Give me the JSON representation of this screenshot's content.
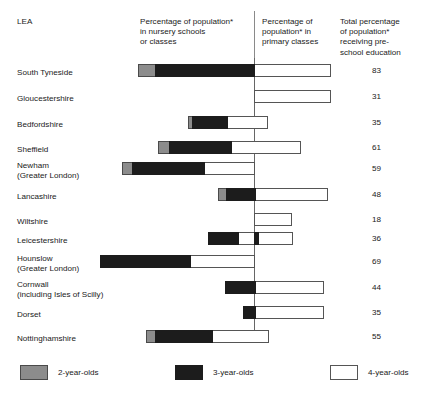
{
  "header": {
    "lea_label": "LEA",
    "col_nursery": "Percentage of population*\nin nursery schools\nor classes",
    "col_primary": "Percentage of\npopulation* in\nprimary classes",
    "col_total": "Total percentage\nof population*\nreceiving pre-\nschool education"
  },
  "legend": {
    "items": [
      {
        "label": "2-year-olds",
        "color": "#8c8c8c",
        "key": "two"
      },
      {
        "label": "3-year-olds",
        "color": "#1c1c1c",
        "key": "three"
      },
      {
        "label": "4-year-olds",
        "color": "#ffffff",
        "key": "four"
      }
    ]
  },
  "chart_data": {
    "type": "bar",
    "title": "",
    "subtitle": "",
    "xlabel": "",
    "ylabel": "LEA",
    "orientation": "horizontal",
    "stacked": true,
    "grid": false,
    "legend_position": "bottom",
    "divider_note": "Vertical line separates nursery-school percentage (left) from primary-class percentage (right)",
    "series": [
      {
        "name": "2-year-olds",
        "color": "#8c8c8c"
      },
      {
        "name": "3-year-olds",
        "color": "#1c1c1c"
      },
      {
        "name": "4-year-olds",
        "color": "#ffffff"
      }
    ],
    "categories": [
      "South Tyneside",
      "Gloucestershire",
      "Bedfordshire",
      "Sheffield",
      "Newham (Greater London)",
      "Lancashire",
      "Wiltshire",
      "Leicestershire",
      "Hounslow (Greater London)",
      "Cornwall (including Isles of Scilly)",
      "Dorset",
      "Nottinghamshire"
    ],
    "values": [
      83,
      31,
      35,
      61,
      59,
      48,
      18,
      36,
      69,
      44,
      35,
      55
    ]
  },
  "rows": [
    {
      "label": "South Tyneside",
      "total": "83",
      "top": 64,
      "label_top": 68,
      "segments": [
        {
          "type": "2",
          "left": 138,
          "width": 18
        },
        {
          "type": "3",
          "left": 155,
          "width": 100
        },
        {
          "type": "4",
          "left": 254,
          "width": 77
        }
      ]
    },
    {
      "label": "Gloucestershire",
      "total": "31",
      "top": 90,
      "label_top": 94,
      "segments": [
        {
          "type": "4",
          "left": 254,
          "width": 77
        }
      ]
    },
    {
      "label": "Bedfordshire",
      "total": "35",
      "top": 116,
      "label_top": 120,
      "segments": [
        {
          "type": "2",
          "left": 188,
          "width": 5
        },
        {
          "type": "3",
          "left": 192,
          "width": 36
        },
        {
          "type": "4",
          "left": 227,
          "width": 41
        }
      ]
    },
    {
      "label": "Sheffield",
      "total": "61",
      "top": 141,
      "label_top": 145,
      "segments": [
        {
          "type": "2",
          "left": 158,
          "width": 12
        },
        {
          "type": "3",
          "left": 169,
          "width": 63
        },
        {
          "type": "4",
          "left": 231,
          "width": 70
        }
      ]
    },
    {
      "label": "Newham\n(Greater London)",
      "total": "59",
      "top": 162,
      "label_top": 161,
      "segments": [
        {
          "type": "2",
          "left": 122,
          "width": 11
        },
        {
          "type": "3",
          "left": 132,
          "width": 73
        },
        {
          "type": "4",
          "left": 204,
          "width": 51
        }
      ]
    },
    {
      "label": "Lancashire",
      "total": "48",
      "top": 188,
      "label_top": 192,
      "segments": [
        {
          "type": "2",
          "left": 218,
          "width": 9
        },
        {
          "type": "3",
          "left": 226,
          "width": 30
        },
        {
          "type": "4",
          "left": 255,
          "width": 73
        }
      ]
    },
    {
      "label": "Wiltshire",
      "total": "18",
      "top": 213,
      "label_top": 217,
      "segments": [
        {
          "type": "4",
          "left": 254,
          "width": 38
        }
      ]
    },
    {
      "label": "Leicestershire",
      "total": "36",
      "top": 232,
      "label_top": 236,
      "segments": [
        {
          "type": "3",
          "left": 208,
          "width": 31
        },
        {
          "type": "4",
          "left": 238,
          "width": 17
        },
        {
          "type": "3",
          "left": 254,
          "width": 5
        },
        {
          "type": "4",
          "left": 258,
          "width": 35
        }
      ]
    },
    {
      "label": "Hounslow\n(Greater London)",
      "total": "69",
      "top": 255,
      "label_top": 254,
      "segments": [
        {
          "type": "3",
          "left": 100,
          "width": 91
        },
        {
          "type": "4",
          "left": 190,
          "width": 65
        }
      ]
    },
    {
      "label": "Cornwall\n(including Isles of Scilly)",
      "total": "44",
      "top": 281,
      "label_top": 280,
      "segments": [
        {
          "type": "3",
          "left": 225,
          "width": 31
        },
        {
          "type": "4",
          "left": 255,
          "width": 69
        }
      ]
    },
    {
      "label": "Dorset",
      "total": "35",
      "top": 306,
      "label_top": 310,
      "segments": [
        {
          "type": "3",
          "left": 243,
          "width": 13
        },
        {
          "type": "4",
          "left": 255,
          "width": 69
        }
      ]
    },
    {
      "label": "Nottinghamshire",
      "total": "55",
      "top": 330,
      "label_top": 334,
      "segments": [
        {
          "type": "2",
          "left": 146,
          "width": 10
        },
        {
          "type": "3",
          "left": 155,
          "width": 58
        },
        {
          "type": "4",
          "left": 212,
          "width": 57
        }
      ]
    }
  ]
}
